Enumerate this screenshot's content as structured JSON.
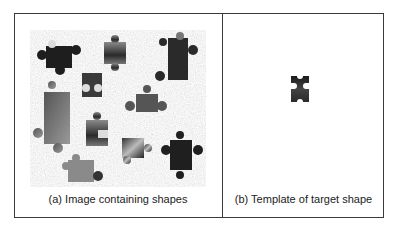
{
  "panels": [
    {
      "id": "a",
      "caption": "(a) Image containing shapes"
    },
    {
      "id": "b",
      "caption": "(b) Template of target shape"
    }
  ],
  "scene": {
    "background": "noisy-gray-texture",
    "piece_count": 11,
    "pieces": [
      {
        "shape": "jigsaw-piece",
        "tone": "dark",
        "x": 12,
        "y": 8
      },
      {
        "shape": "jigsaw-piece",
        "tone": "gray-gradient",
        "x": 75,
        "y": 5
      },
      {
        "shape": "jigsaw-piece",
        "tone": "dark-photo",
        "x": 135,
        "y": 3
      },
      {
        "shape": "jigsaw-piece",
        "tone": "dark-template-match",
        "x": 48,
        "y": 40
      },
      {
        "shape": "jigsaw-piece",
        "tone": "photo",
        "x": 12,
        "y": 55
      },
      {
        "shape": "jigsaw-piece",
        "tone": "dark-gray",
        "x": 98,
        "y": 58
      },
      {
        "shape": "jigsaw-piece",
        "tone": "dark-gradient",
        "x": 55,
        "y": 85
      },
      {
        "shape": "jigsaw-piece",
        "tone": "mixed",
        "x": 90,
        "y": 103
      },
      {
        "shape": "jigsaw-piece",
        "tone": "dark",
        "x": 132,
        "y": 95
      },
      {
        "shape": "jigsaw-piece",
        "tone": "gray",
        "x": 35,
        "y": 125
      }
    ]
  },
  "colors": {
    "frame": "#3a3a3a",
    "text": "#222222",
    "noise_base": "#d9d9d9"
  }
}
